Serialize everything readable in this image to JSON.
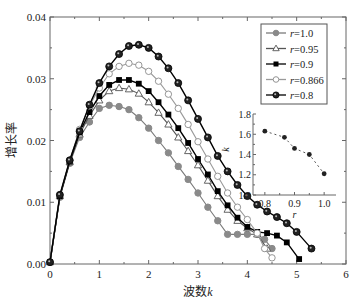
{
  "chart_data": {
    "type": "line",
    "title": "",
    "xlabel": "波数k",
    "ylabel": "增长率",
    "xlim": [
      0,
      6
    ],
    "ylim": [
      0,
      0.04
    ],
    "xticks": [
      "0",
      "1",
      "2",
      "3",
      "4",
      "5",
      "6"
    ],
    "yticks": [
      "0.00",
      "0.01",
      "0.02",
      "0.03",
      "0.04"
    ],
    "legend_position": "upper right",
    "series": [
      {
        "name": "r=1.0",
        "marker": "circle-gray",
        "color": "#7a7a7a",
        "x": [
          0,
          0.2,
          0.4,
          0.6,
          0.8,
          1.0,
          1.2,
          1.4,
          1.6,
          1.8,
          2.0,
          2.2,
          2.4,
          2.6,
          2.8,
          3.0,
          3.2,
          3.4,
          3.6,
          3.8,
          4.0,
          4.2,
          4.35,
          4.5
        ],
        "y": [
          0.0003,
          0.0108,
          0.0163,
          0.0205,
          0.023,
          0.0252,
          0.0257,
          0.0255,
          0.025,
          0.0237,
          0.022,
          0.02,
          0.018,
          0.0158,
          0.0137,
          0.0115,
          0.0092,
          0.007,
          0.0048,
          0.0048,
          0.0048,
          0.0048,
          0.004,
          0.0025
        ]
      },
      {
        "name": "r=0.95",
        "marker": "triangle-open",
        "color": "#555555",
        "x": [
          0,
          0.2,
          0.4,
          0.6,
          0.8,
          1.0,
          1.2,
          1.4,
          1.6,
          1.8,
          2.0,
          2.2,
          2.4,
          2.6,
          2.8,
          3.0,
          3.2,
          3.4,
          3.6,
          3.8,
          4.0,
          4.2,
          4.4
        ],
        "y": [
          0.0003,
          0.011,
          0.0165,
          0.021,
          0.024,
          0.0265,
          0.028,
          0.0285,
          0.0283,
          0.0276,
          0.0262,
          0.0245,
          0.0226,
          0.0205,
          0.0183,
          0.016,
          0.0135,
          0.011,
          0.0088,
          0.007,
          0.0058,
          0.0048,
          0.0025
        ]
      },
      {
        "name": "r=0.9",
        "marker": "square-filled",
        "color": "#000000",
        "x": [
          0,
          0.2,
          0.4,
          0.6,
          0.8,
          1.0,
          1.2,
          1.4,
          1.6,
          1.8,
          2.0,
          2.2,
          2.4,
          2.6,
          2.8,
          3.0,
          3.2,
          3.4,
          3.6,
          3.8,
          4.0,
          4.2,
          4.4,
          4.6,
          4.8,
          5.05
        ],
        "y": [
          0.0003,
          0.011,
          0.0166,
          0.0213,
          0.0246,
          0.0272,
          0.029,
          0.0298,
          0.0298,
          0.0292,
          0.028,
          0.0262,
          0.0242,
          0.022,
          0.0196,
          0.017,
          0.0145,
          0.0118,
          0.0095,
          0.0075,
          0.006,
          0.0052,
          0.005,
          0.0046,
          0.0035,
          0.0008
        ]
      },
      {
        "name": "r=0.866",
        "marker": "circle-open",
        "color": "#9a9a9a",
        "x": [
          0,
          0.2,
          0.4,
          0.6,
          0.8,
          1.0,
          1.2,
          1.4,
          1.6,
          1.8,
          2.0,
          2.2,
          2.4,
          2.6,
          2.8,
          3.0,
          3.2,
          3.4,
          3.6,
          3.8,
          4.0,
          4.2,
          4.35,
          4.5
        ],
        "y": [
          0.0003,
          0.0112,
          0.0168,
          0.0218,
          0.0256,
          0.0285,
          0.0308,
          0.032,
          0.0325,
          0.0322,
          0.0312,
          0.0296,
          0.0275,
          0.0252,
          0.0226,
          0.0198,
          0.017,
          0.0142,
          0.0115,
          0.0092,
          0.0072,
          0.005,
          0.0025,
          0.001
        ]
      },
      {
        "name": "r=0.8",
        "marker": "circle-dark",
        "color": "#000000",
        "x": [
          0,
          0.2,
          0.4,
          0.6,
          0.8,
          1.0,
          1.2,
          1.4,
          1.6,
          1.8,
          2.0,
          2.2,
          2.4,
          2.6,
          2.8,
          3.0,
          3.2,
          3.4,
          3.6,
          3.8,
          4.0,
          4.2,
          4.4,
          4.6,
          4.8,
          5.0,
          5.3
        ],
        "y": [
          0.0003,
          0.0112,
          0.0168,
          0.0215,
          0.0258,
          0.0293,
          0.032,
          0.034,
          0.0353,
          0.0355,
          0.035,
          0.0336,
          0.0317,
          0.0293,
          0.0265,
          0.0235,
          0.0205,
          0.0175,
          0.015,
          0.0128,
          0.011,
          0.0096,
          0.0085,
          0.0076,
          0.0066,
          0.0052,
          0.0025
        ]
      }
    ],
    "inset": {
      "type": "scatter",
      "xlabel": "r",
      "ylabel": "k",
      "xlim": [
        0.76,
        1.04
      ],
      "ylim": [
        1.0,
        1.8
      ],
      "xticks": [
        "0.8",
        "0.9",
        "1.0"
      ],
      "yticks": [
        "1.0",
        "1.2",
        "1.4",
        "1.6",
        "1.8"
      ],
      "line_style": "dashed",
      "x": [
        0.8,
        0.866,
        0.9,
        0.95,
        1.0
      ],
      "y": [
        1.63,
        1.57,
        1.46,
        1.4,
        1.21
      ]
    }
  }
}
